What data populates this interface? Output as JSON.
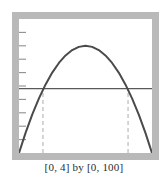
{
  "caption": "[0, 4] by [0, 100]",
  "colors": {
    "frame": "#b9b9b9",
    "screen_background": "#ffffff",
    "curve": "#4a4a4a",
    "horizontal_line": "#595959",
    "dashed_line": "#c4c4c4",
    "tick": "#8f8f8f",
    "caption_text": "#2b2b2b"
  },
  "chart_data": {
    "type": "line",
    "title": "",
    "xlabel": "",
    "ylabel": "",
    "xlim": [
      0,
      4
    ],
    "ylim": [
      0,
      100
    ],
    "grid": false,
    "legend": "none",
    "y_tick_count": 9,
    "y_tick_step": 10,
    "y_ticks": [
      10,
      20,
      30,
      40,
      50,
      60,
      70,
      80,
      90
    ],
    "x_ticks": [],
    "series": [
      {
        "name": "parabola",
        "type": "line",
        "style": "solid",
        "color": "#4a4a4a",
        "vertex": [
          2.0,
          80
        ],
        "x": [
          0.0,
          0.2,
          0.4,
          0.6,
          0.8,
          1.0,
          1.2,
          1.4,
          1.6,
          1.8,
          2.0,
          2.2,
          2.4,
          2.6,
          2.8,
          3.0,
          3.2,
          3.4,
          3.6,
          3.8,
          4.0
        ],
        "values": [
          0,
          15.2,
          28.8,
          40.8,
          51.2,
          60,
          67.2,
          72.8,
          76.8,
          79.2,
          80,
          79.2,
          76.8,
          72.8,
          67.2,
          60,
          51.2,
          40.8,
          28.8,
          15.2,
          0
        ]
      },
      {
        "name": "horizontal-line",
        "type": "hline",
        "style": "solid",
        "color": "#595959",
        "y": 48,
        "x": [
          0,
          4
        ],
        "values": [
          48,
          48
        ]
      },
      {
        "name": "left-dashed-drop",
        "type": "vline",
        "style": "dashed",
        "color": "#c4c4c4",
        "x": 0.72,
        "y_from": 0,
        "y_to": 48
      },
      {
        "name": "right-dashed-drop",
        "type": "vline",
        "style": "dashed",
        "color": "#c4c4c4",
        "x": 3.28,
        "y_from": 0,
        "y_to": 48
      }
    ],
    "annotations": [
      {
        "label": "[0, 4] by [0, 100]",
        "position": "below-plot"
      }
    ]
  }
}
